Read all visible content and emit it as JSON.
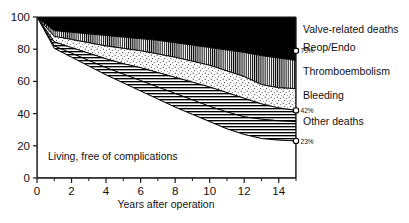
{
  "chart_data": {
    "type": "area",
    "title": "",
    "xlabel": "Years after operation",
    "ylabel": "",
    "xlim": [
      0,
      15
    ],
    "ylim": [
      0,
      100
    ],
    "grid": false,
    "legend_position": "right",
    "stacking": "cumulative-from-top",
    "xticks": [
      0,
      2,
      4,
      6,
      8,
      10,
      12,
      14
    ],
    "xtick_labels": [
      "0",
      "2",
      "4",
      "6",
      "8",
      "10",
      "12",
      "14"
    ],
    "xminor_ticks": [
      1,
      3,
      5,
      7,
      9,
      11,
      13,
      15
    ],
    "yticks": [
      0,
      20,
      40,
      60,
      80,
      100
    ],
    "ytick_labels": [
      "0",
      "20",
      "40",
      "60",
      "80",
      "100"
    ],
    "x": [
      0,
      1,
      2,
      3,
      4,
      5,
      6,
      7,
      8,
      9,
      10,
      11,
      12,
      13,
      14,
      15
    ],
    "series": [
      {
        "name": "Valve-related deaths",
        "fill": "solid-black",
        "boundary_top": [
          100,
          100,
          100,
          100,
          100,
          100,
          100,
          100,
          100,
          100,
          100,
          100,
          100,
          100,
          100,
          100
        ],
        "boundary_bottom": [
          100,
          91.5,
          90.5,
          89.5,
          88.5,
          87.5,
          86.5,
          85.5,
          84.0,
          82.5,
          81.0,
          79.5,
          78.0,
          76.0,
          74.5,
          73.0
        ],
        "end_label": "79%",
        "end_value": 79
      },
      {
        "name": "Reop/Endo",
        "fill": "vertical-lines",
        "boundary_top": [
          100,
          91.5,
          90.5,
          89.5,
          88.5,
          87.5,
          86.5,
          85.5,
          84.0,
          82.5,
          81.0,
          79.5,
          78.0,
          76.0,
          74.5,
          73.0
        ],
        "boundary_bottom": [
          100,
          88.0,
          86.0,
          84.0,
          82.0,
          80.5,
          79.0,
          77.0,
          75.0,
          72.5,
          70.0,
          66.5,
          63.0,
          58.0,
          56.0,
          55.5
        ]
      },
      {
        "name": "Thromboembolism",
        "fill": "stippled",
        "boundary_top": [
          100,
          88.0,
          86.0,
          84.0,
          82.0,
          80.5,
          79.0,
          77.0,
          75.0,
          72.5,
          70.0,
          66.5,
          63.0,
          58.0,
          56.0,
          55.5
        ],
        "boundary_bottom": [
          100,
          84.5,
          81.0,
          77.5,
          74.0,
          71.0,
          68.5,
          65.5,
          62.5,
          59.5,
          56.5,
          53.0,
          49.5,
          46.0,
          43.5,
          42.0
        ]
      },
      {
        "name": "Bleeding",
        "fill": "horizontal-lines",
        "boundary_top": [
          100,
          84.5,
          81.0,
          77.5,
          74.0,
          71.0,
          68.5,
          65.5,
          62.5,
          59.5,
          56.5,
          53.0,
          49.5,
          46.0,
          43.5,
          42.0
        ],
        "boundary_bottom": [
          100,
          82.0,
          77.5,
          73.0,
          68.5,
          64.5,
          60.5,
          56.5,
          52.5,
          48.5,
          44.5,
          41.0,
          38.0,
          36.5,
          35.5,
          35.0
        ],
        "end_label": "42%",
        "end_value": 42
      },
      {
        "name": "Other deaths",
        "fill": "horizontal-lines",
        "boundary_top": [
          100,
          82.0,
          77.5,
          73.0,
          68.5,
          64.5,
          60.5,
          56.5,
          52.5,
          48.5,
          44.5,
          41.0,
          38.0,
          36.5,
          35.5,
          35.0
        ],
        "boundary_bottom": [
          100,
          80.5,
          75.0,
          69.5,
          64.0,
          59.0,
          54.0,
          49.0,
          44.0,
          39.5,
          35.0,
          30.5,
          27.0,
          24.5,
          23.5,
          23.0
        ],
        "end_label": "23%",
        "end_value": 23
      },
      {
        "name": "Living, free of complications",
        "fill": "white",
        "boundary_top": [
          100,
          80.5,
          75.0,
          69.5,
          64.0,
          59.0,
          54.0,
          49.0,
          44.0,
          39.5,
          35.0,
          30.5,
          27.0,
          24.5,
          23.5,
          23.0
        ],
        "boundary_bottom": [
          0,
          0,
          0,
          0,
          0,
          0,
          0,
          0,
          0,
          0,
          0,
          0,
          0,
          0,
          0,
          0
        ]
      }
    ],
    "annotations": [
      {
        "text": "Living, free of complications",
        "x": 1.1,
        "y": 12
      }
    ],
    "endpoint_markers": [
      {
        "label": "79%",
        "value": 79
      },
      {
        "label": "42%",
        "value": 42
      },
      {
        "label": "23%",
        "value": 23
      }
    ]
  },
  "axes": {
    "x_title": "Years after operation",
    "x_tick_labels": [
      "0",
      "2",
      "4",
      "6",
      "8",
      "10",
      "12",
      "14"
    ],
    "y_tick_labels": [
      "0",
      "20",
      "40",
      "60",
      "80",
      "100"
    ]
  },
  "legend": {
    "items": [
      {
        "label": "Valve-related deaths",
        "pct": "79%"
      },
      {
        "label": "Reop/Endo",
        "pct": ""
      },
      {
        "label": "Thromboembolism",
        "pct": ""
      },
      {
        "label": "Bleeding",
        "pct": "42%"
      },
      {
        "label": "Other deaths",
        "pct": "23%"
      }
    ]
  },
  "plot_annotation": "Living, free of complications",
  "colors": {
    "ink": "#000000",
    "background": "#ffffff",
    "axis": "#1a1a1a"
  }
}
